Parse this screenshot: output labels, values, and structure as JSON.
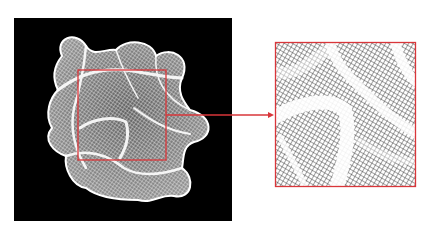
{
  "figure": {
    "left_panel": {
      "background": "#000000",
      "subject": "wireframe-mesh-blob"
    },
    "highlight_box": {
      "x": 78,
      "y": 70,
      "width": 88,
      "height": 90,
      "color": "#d9363a"
    },
    "arrow": {
      "from_x": 166,
      "to_x": 273,
      "y": 115,
      "color": "#d9363a"
    },
    "inset_panel": {
      "x": 275,
      "y": 42,
      "width": 141,
      "height": 145,
      "border_color": "#d9363a",
      "subject": "zoomed-mesh-detail"
    }
  },
  "colors": {
    "accent": "#d9363a",
    "mesh": "#ffffff",
    "background": "#000000"
  }
}
